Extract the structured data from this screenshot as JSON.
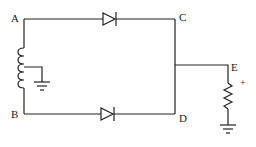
{
  "diagram": {
    "type": "center-tapped full-wave rectifier circuit",
    "nodes": {
      "a": "A",
      "b": "B",
      "c": "C",
      "d": "D",
      "e": "E"
    },
    "output_polarity": "+",
    "components": [
      {
        "name": "center-tapped transformer secondary (inductor)",
        "between": [
          "A",
          "B"
        ],
        "tap": "ground"
      },
      {
        "name": "diode",
        "between": [
          "A",
          "C"
        ],
        "orientation": "anode A, cathode C"
      },
      {
        "name": "diode",
        "between": [
          "B",
          "D"
        ],
        "orientation": "anode B, cathode D"
      },
      {
        "name": "load resistor",
        "between": [
          "E",
          "ground"
        ]
      }
    ],
    "colors": {
      "line": "#222222",
      "background": "#ffffff"
    }
  }
}
